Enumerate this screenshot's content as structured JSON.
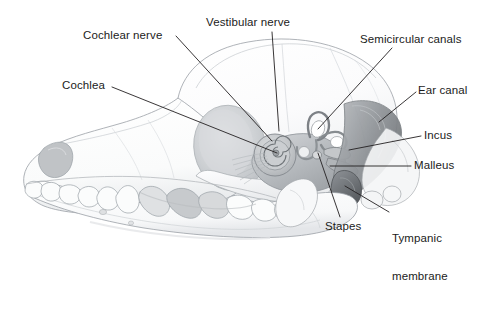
{
  "figure": {
    "background_color": "#ffffff",
    "label_color": "#1b1b1b",
    "leader_line_color": "#231f20",
    "bone_fill": "#fdfdfd",
    "bone_outline": "#8d9298",
    "shadow_gray": "#c9cbcd",
    "mid_gray": "#a8abae",
    "dark_gray": "#7e8387"
  },
  "labels": [
    {
      "id": "cochlear-nerve",
      "text": "Cochlear nerve",
      "x": 83,
      "y": 30,
      "anchor": "start"
    },
    {
      "id": "vestibular-nerve",
      "text": "Vestibular nerve",
      "x": 206,
      "y": 17,
      "anchor": "start"
    },
    {
      "id": "semicircular-canals",
      "text": "Semicircular canals",
      "x": 360,
      "y": 34,
      "anchor": "start"
    },
    {
      "id": "cochlea",
      "text": "Cochlea",
      "x": 62,
      "y": 80,
      "anchor": "start"
    },
    {
      "id": "ear-canal",
      "text": "Ear canal",
      "x": 418,
      "y": 85,
      "anchor": "start"
    },
    {
      "id": "incus",
      "text": "Incus",
      "x": 424,
      "y": 130,
      "anchor": "start"
    },
    {
      "id": "malleus",
      "text": "Malleus",
      "x": 414,
      "y": 160,
      "anchor": "start"
    },
    {
      "id": "stapes",
      "text": "Stapes",
      "x": 325,
      "y": 221,
      "anchor": "start"
    },
    {
      "id": "tympanic-membrane",
      "text": "Tympanic\nmembrane",
      "line1": "Tympanic",
      "line2": "membrane",
      "x": 392,
      "y": 208,
      "anchor": "start"
    }
  ],
  "leader_lines": [
    {
      "id": "cochlear-nerve-leader",
      "from": [
        176,
        36
      ],
      "to": [
        272,
        141
      ]
    },
    {
      "id": "vestibular-nerve-leader",
      "from": [
        272,
        32
      ],
      "to": [
        279,
        131
      ]
    },
    {
      "id": "cochlea-leader",
      "from": [
        112,
        87
      ],
      "to": [
        277,
        153
      ]
    },
    {
      "id": "semicircular-canals-leader",
      "from": [
        392,
        48
      ],
      "to": [
        318,
        129
      ]
    },
    {
      "id": "ear-canal-leader",
      "from": [
        416,
        92
      ],
      "to": [
        379,
        122
      ]
    },
    {
      "id": "incus-leader",
      "from": [
        421,
        136
      ],
      "to": [
        349,
        150
      ]
    },
    {
      "id": "malleus-leader",
      "from": [
        411,
        166
      ],
      "to": [
        330,
        166
      ]
    },
    {
      "id": "stapes-leader",
      "from": [
        340,
        217
      ],
      "to": [
        318,
        153
      ]
    },
    {
      "id": "tympanic-membrane-leader",
      "from": [
        389,
        212
      ],
      "to": [
        345,
        186
      ]
    }
  ],
  "anatomy_parts": [
    {
      "id": "skull",
      "name": "dog skull"
    },
    {
      "id": "mandible",
      "name": "mandible with teeth"
    },
    {
      "id": "cranium",
      "name": "cranial vault"
    },
    {
      "id": "cochlea-structure",
      "name": "cochlea spiral"
    },
    {
      "id": "semicircular-canals-structure",
      "name": "semicircular canals loops"
    },
    {
      "id": "ear-canal-structure",
      "name": "external ear canal"
    },
    {
      "id": "tympanic-membrane-structure",
      "name": "tympanic membrane"
    },
    {
      "id": "ossicles",
      "name": "malleus incus stapes ossicles"
    },
    {
      "id": "nerve-bundle",
      "name": "vestibulocochlear nerve fibers"
    },
    {
      "id": "teeth",
      "name": "upper and lower dentition"
    },
    {
      "id": "nasal-opening",
      "name": "nasal aperture"
    },
    {
      "id": "orbit",
      "name": "orbital fossa"
    }
  ]
}
